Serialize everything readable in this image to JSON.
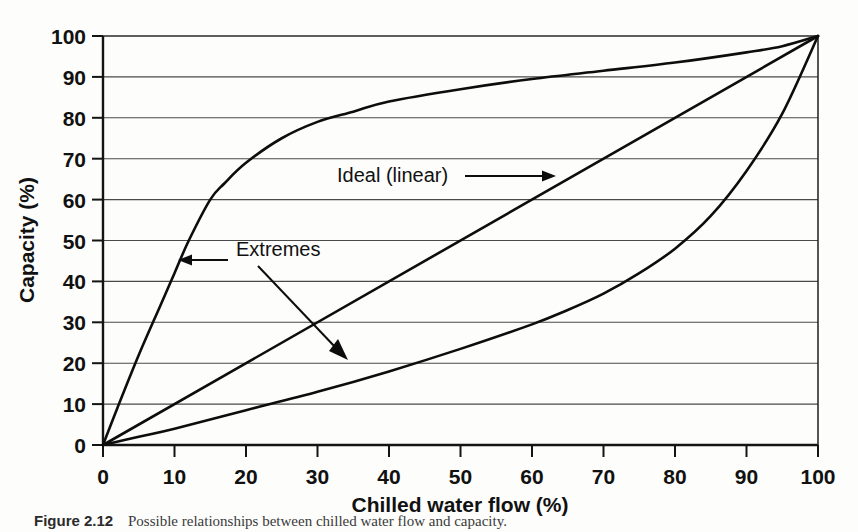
{
  "figure": {
    "caption_number": "Figure 2.12",
    "caption_text": "Possible relationships between chilled water flow and capacity."
  },
  "chart_data": {
    "type": "line",
    "title": "",
    "subtitle": "",
    "xlabel": "Chilled water flow (%)",
    "ylabel": "Capacity (%)",
    "xlim": [
      0,
      100
    ],
    "ylim": [
      0,
      100
    ],
    "xticks": [
      0,
      10,
      20,
      30,
      40,
      50,
      60,
      70,
      80,
      90,
      100
    ],
    "yticks": [
      0,
      10,
      20,
      30,
      40,
      50,
      60,
      70,
      80,
      90,
      100
    ],
    "xtick_labels": [
      "0",
      "10",
      "20",
      "30",
      "40",
      "50",
      "60",
      "70",
      "80",
      "90",
      "100"
    ],
    "ytick_labels": [
      "0",
      "10",
      "20",
      "30",
      "40",
      "50",
      "60",
      "70",
      "80",
      "90",
      "100"
    ],
    "grid": "horizontal",
    "legend": "none",
    "series": [
      {
        "name": "Extreme (quick-opening)",
        "x": [
          0,
          2,
          5,
          8,
          10,
          12,
          15,
          17,
          20,
          25,
          30,
          35,
          40,
          50,
          60,
          70,
          80,
          90,
          95,
          100
        ],
        "y": [
          0,
          9,
          22,
          34,
          42,
          50,
          60,
          64,
          69,
          75,
          79,
          81.5,
          84,
          87,
          89.5,
          91.5,
          93.5,
          96,
          97.5,
          100
        ]
      },
      {
        "name": "Ideal (linear)",
        "x": [
          0,
          10,
          20,
          30,
          40,
          50,
          60,
          70,
          80,
          90,
          100
        ],
        "y": [
          0,
          10,
          20,
          30,
          40,
          50,
          60,
          70,
          80,
          90,
          100
        ]
      },
      {
        "name": "Extreme (equal-percentage)",
        "x": [
          0,
          5,
          10,
          20,
          30,
          40,
          50,
          60,
          65,
          70,
          75,
          80,
          85,
          90,
          95,
          100
        ],
        "y": [
          0,
          2,
          4,
          8.5,
          13,
          18,
          23.5,
          29.5,
          33,
          37,
          42,
          48,
          56,
          67,
          81,
          100
        ]
      }
    ],
    "annotations": [
      {
        "id": "ideal-linear",
        "text": "Ideal (linear)",
        "arrow": "right",
        "points_to_series": "Ideal (linear)"
      },
      {
        "id": "extremes",
        "text": "Extremes",
        "arrow": "left-and-down-right",
        "points_to_series": "Extreme (quick-opening), Extreme (equal-percentage)"
      }
    ]
  },
  "colors": {
    "curve": "#0d0d0d",
    "grid": "#4a4a4a",
    "axis": "#141414",
    "text": "#111111",
    "background": "#fdfdfc"
  }
}
